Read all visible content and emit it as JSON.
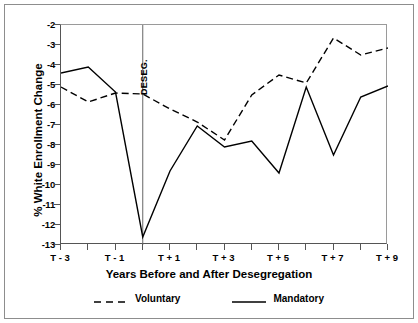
{
  "chart_data": {
    "type": "line",
    "title": "",
    "xlabel": "Years Before and After Desegregation",
    "ylabel": "% White Enrollment Change",
    "x": [
      "T-3",
      "T-2",
      "T-1",
      "T",
      "T+1",
      "T+2",
      "T+3",
      "T+4",
      "T+5",
      "T+6",
      "T+7",
      "T+8",
      "T+9"
    ],
    "x_tick_labels": [
      "T - 3",
      "",
      "T - 1",
      "",
      "T + 1",
      "",
      "T + 3",
      "",
      "T + 5",
      "",
      "T + 7",
      "",
      "T + 9"
    ],
    "y_tick_labels": [
      "-2",
      "-3",
      "-4",
      "-5",
      "-6",
      "-7",
      "-8",
      "-9",
      "-10",
      "-11",
      "-12",
      "-13"
    ],
    "y_tick_values": [
      -2,
      -3,
      -4,
      -5,
      -6,
      -7,
      -8,
      -9,
      -10,
      -11,
      -12,
      -13
    ],
    "ylim": [
      -13,
      -2
    ],
    "xlim": [
      0,
      12
    ],
    "grid": false,
    "legend_position": "below",
    "annotations": [
      {
        "text": "DESEG.",
        "x": "T",
        "orientation": "vertical",
        "type": "vertical-reference-line"
      }
    ],
    "series": [
      {
        "name": "Voluntary",
        "style": "dashed",
        "color": "#000000",
        "values": [
          -5.1,
          -5.85,
          -5.4,
          -5.45,
          -6.2,
          -6.85,
          -7.75,
          -5.5,
          -4.5,
          -4.9,
          -2.65,
          -3.5,
          -3.15
        ]
      },
      {
        "name": "Mandatory",
        "style": "solid",
        "color": "#000000",
        "values": [
          -4.4,
          -4.1,
          -5.35,
          -12.6,
          -9.3,
          -7.05,
          -8.1,
          -7.8,
          -9.4,
          -5.1,
          -8.5,
          -5.6,
          -5.05
        ]
      }
    ]
  },
  "axes": {
    "y_title": "% White Enrollment Change",
    "x_title": "Years Before and After Desegregation"
  },
  "annotation": {
    "deseg_label": "DESEG."
  },
  "legend": {
    "entries": [
      {
        "label": "Voluntary",
        "style": "dashed"
      },
      {
        "label": "Mandatory",
        "style": "solid"
      }
    ]
  }
}
